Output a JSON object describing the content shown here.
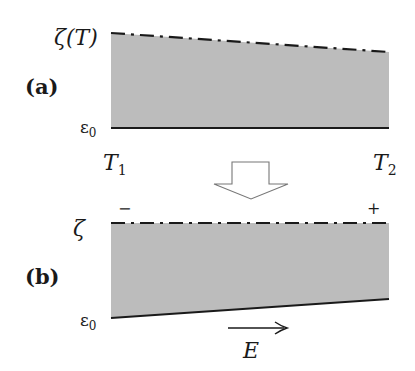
{
  "colors": {
    "band_fill": "#bcbcbc",
    "line": "#1a1a1a",
    "outline": "#777777"
  },
  "panel_a": {
    "label": "(a)",
    "top_label": "ζ(T)",
    "bottom_label": "ε",
    "bottom_label_sub": "0",
    "left_temp": "T",
    "left_temp_sub": "1",
    "right_temp": "T",
    "right_temp_sub": "2",
    "top_line_style": "dash-dot, sloping down left to right",
    "bottom_line_style": "solid, horizontal"
  },
  "transition_arrow": {
    "direction": "down",
    "style": "hollow block arrow"
  },
  "panel_b": {
    "label": "(b)",
    "top_label": "ζ",
    "bottom_label": "ε",
    "bottom_label_sub": "0",
    "left_sign": "−",
    "right_sign": "+",
    "field_label": "E",
    "field_direction": "right",
    "top_line_style": "dash-dot, horizontal",
    "bottom_line_style": "solid, sloping up left to right"
  }
}
